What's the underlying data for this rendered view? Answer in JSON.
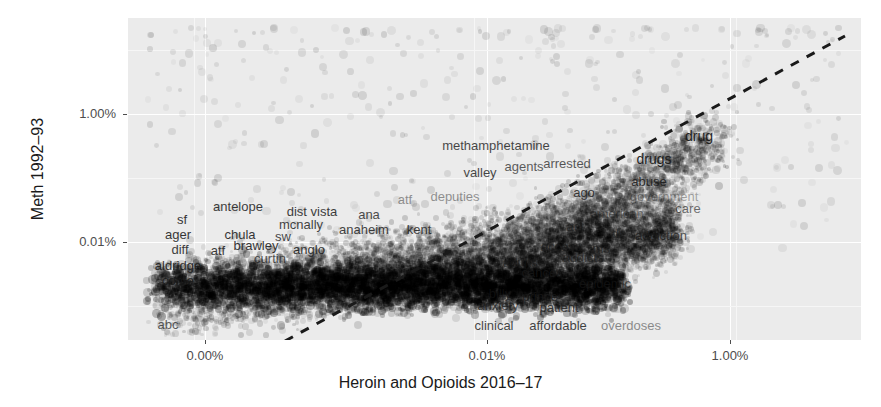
{
  "chart_data": {
    "type": "scatter",
    "title": "",
    "xlabel": "Heroin and Opioids 2016–17",
    "ylabel": "Meth 1992–93",
    "xticks": [
      "0.00%",
      "0.01%",
      "1.00%"
    ],
    "yticks": [
      "1.00%",
      "0.01%"
    ],
    "xtick_positions": [
      205,
      487,
      730
    ],
    "ytick_positions": [
      114,
      242
    ],
    "grid": true,
    "legend": "none",
    "panel_background": "#ebebeb",
    "grid_color": "#ffffff",
    "point_color": "#000000",
    "trendline": {
      "style": "dashed",
      "color": "#1a1a1a",
      "x1": 285,
      "y1": 341,
      "x2": 845,
      "y2": 36
    },
    "note": "Dense overplotted scatter of word frequencies; log-like axes. Labelled points listed in labels[]",
    "labels": [
      {
        "text": "methamphetamine",
        "x": 496,
        "y": 145,
        "size": 13,
        "opacity": 0.8
      },
      {
        "text": "drug",
        "x": 699,
        "y": 136,
        "size": 14,
        "opacity": 0.95
      },
      {
        "text": "drugs",
        "x": 654,
        "y": 159,
        "size": 14,
        "opacity": 0.95
      },
      {
        "text": "abuse",
        "x": 649,
        "y": 181,
        "size": 13,
        "opacity": 0.85
      },
      {
        "text": "government",
        "x": 664,
        "y": 196,
        "size": 13,
        "opacity": 0.35
      },
      {
        "text": "care",
        "x": 688,
        "y": 208,
        "size": 13,
        "opacity": 0.62
      },
      {
        "text": "american",
        "x": 617,
        "y": 213,
        "size": 13,
        "opacity": 0.45
      },
      {
        "text": "addiction",
        "x": 661,
        "y": 235,
        "size": 13,
        "opacity": 0.72
      },
      {
        "text": "arrested",
        "x": 567,
        "y": 163,
        "size": 13,
        "opacity": 0.72
      },
      {
        "text": "agents",
        "x": 524,
        "y": 166,
        "size": 13,
        "opacity": 0.7
      },
      {
        "text": "valley",
        "x": 480,
        "y": 172,
        "size": 13,
        "opacity": 0.8
      },
      {
        "text": "ago",
        "x": 584,
        "y": 192,
        "size": 13,
        "opacity": 0.82
      },
      {
        "text": "act",
        "x": 575,
        "y": 226,
        "size": 13,
        "opacity": 0.55
      },
      {
        "text": "dr",
        "x": 617,
        "y": 233,
        "size": 13,
        "opacity": 0.55
      },
      {
        "text": "ms",
        "x": 601,
        "y": 248,
        "size": 13,
        "opacity": 0.6
      },
      {
        "text": "access",
        "x": 561,
        "y": 246,
        "size": 13,
        "opacity": 0.62
      },
      {
        "text": "addicts",
        "x": 583,
        "y": 257,
        "size": 13,
        "opacity": 0.58
      },
      {
        "text": "adults",
        "x": 520,
        "y": 262,
        "size": 13,
        "opacity": 0.62
      },
      {
        "text": "cancer",
        "x": 541,
        "y": 272,
        "size": 13,
        "opacity": 0.72
      },
      {
        "text": "epidemic",
        "x": 605,
        "y": 283,
        "size": 13,
        "opacity": 0.58
      },
      {
        "text": "prince",
        "x": 540,
        "y": 296,
        "size": 13,
        "opacity": 0.8
      },
      {
        "text": "billy",
        "x": 500,
        "y": 293,
        "size": 13,
        "opacity": 0.55
      },
      {
        "text": "patient",
        "x": 559,
        "y": 307,
        "size": 13,
        "opacity": 0.78
      },
      {
        "text": "anxiety",
        "x": 498,
        "y": 305,
        "size": 13,
        "opacity": 0.7
      },
      {
        "text": "clinical",
        "x": 494,
        "y": 325,
        "size": 13,
        "opacity": 0.8
      },
      {
        "text": "affordable",
        "x": 558,
        "y": 325,
        "size": 13,
        "opacity": 0.82
      },
      {
        "text": "overdoses",
        "x": 631,
        "y": 325,
        "size": 13,
        "opacity": 0.48
      },
      {
        "text": "antelope",
        "x": 238,
        "y": 206,
        "size": 13,
        "opacity": 0.85
      },
      {
        "text": "dist vista",
        "x": 312,
        "y": 211,
        "size": 13,
        "opacity": 0.85
      },
      {
        "text": "ana",
        "x": 369,
        "y": 214,
        "size": 13,
        "opacity": 0.78
      },
      {
        "text": "atf",
        "x": 405,
        "y": 199,
        "size": 13,
        "opacity": 0.45
      },
      {
        "text": "deputies",
        "x": 455,
        "y": 196,
        "size": 13,
        "opacity": 0.45
      },
      {
        "text": "sf",
        "x": 182,
        "y": 219,
        "size": 13,
        "opacity": 0.88
      },
      {
        "text": "mcnally",
        "x": 301,
        "y": 224,
        "size": 13,
        "opacity": 0.82
      },
      {
        "text": "anaheim",
        "x": 364,
        "y": 229,
        "size": 13,
        "opacity": 0.82
      },
      {
        "text": "kent",
        "x": 419,
        "y": 229,
        "size": 13,
        "opacity": 0.82
      },
      {
        "text": "ager",
        "x": 178,
        "y": 234,
        "size": 13,
        "opacity": 0.88
      },
      {
        "text": "chula",
        "x": 240,
        "y": 234,
        "size": 13,
        "opacity": 0.88
      },
      {
        "text": "sw",
        "x": 283,
        "y": 236,
        "size": 13,
        "opacity": 0.8
      },
      {
        "text": "diff",
        "x": 180,
        "y": 249,
        "size": 13,
        "opacity": 0.85
      },
      {
        "text": "atf",
        "x": 218,
        "y": 250,
        "size": 13,
        "opacity": 0.85
      },
      {
        "text": "brawley",
        "x": 256,
        "y": 245,
        "size": 13,
        "opacity": 0.88
      },
      {
        "text": "anglo",
        "x": 309,
        "y": 249,
        "size": 13,
        "opacity": 0.85
      },
      {
        "text": "aldridge",
        "x": 178,
        "y": 265,
        "size": 13,
        "opacity": 0.88
      },
      {
        "text": "curtin",
        "x": 270,
        "y": 258,
        "size": 13,
        "opacity": 0.72
      },
      {
        "text": "conte",
        "x": 178,
        "y": 280,
        "size": 13,
        "opacity": 0.78
      },
      {
        "text": "abc",
        "x": 168,
        "y": 324,
        "size": 13,
        "opacity": 0.7
      }
    ]
  }
}
